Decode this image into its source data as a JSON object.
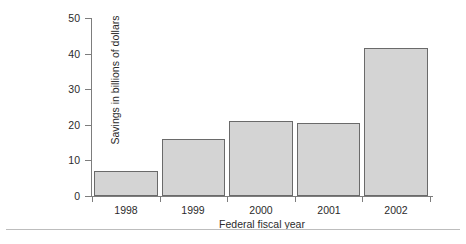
{
  "chart_data": {
    "type": "bar",
    "title": "",
    "subtitle": "",
    "categories": [
      "1998",
      "1999",
      "2000",
      "2001",
      "2002"
    ],
    "values": [
      7.0,
      16.0,
      21.0,
      20.5,
      41.5
    ],
    "xlabel": "Federal fiscal year",
    "ylabel": "Savings in billions of dollars",
    "ylim": [
      0,
      50
    ],
    "yticks": [
      0,
      10,
      20,
      30,
      40,
      50
    ],
    "ytick_labels": [
      "0",
      "10",
      "20",
      "30",
      "40",
      "50"
    ],
    "grid": false,
    "legend": null,
    "legend_position": "none",
    "bar_fill_color": "#d4d4d4",
    "bar_border_color": "#6a6a6a",
    "axis_color": "#7d7d7d",
    "text_color": "#2b2b2b",
    "background_color": "#ffffff",
    "annotations": []
  },
  "figure": {
    "bottom_rule_color": "#bdbdbd"
  }
}
